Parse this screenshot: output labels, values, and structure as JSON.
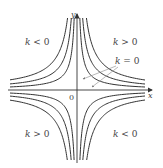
{
  "diagram": {
    "axes": {
      "x_label": "x",
      "y_label": "y",
      "origin_label": "0",
      "origin_px": [
        77,
        90
      ]
    },
    "regions": [
      {
        "id": "top-left",
        "label": "k < 0",
        "var": "k",
        "rel": "< 0"
      },
      {
        "id": "top-right",
        "label": "k > 0",
        "var": "k",
        "rel": "> 0"
      },
      {
        "id": "bottom-left",
        "label": "k > 0",
        "var": "k",
        "rel": "> 0"
      },
      {
        "id": "bottom-right",
        "label": "k < 0",
        "var": "k",
        "rel": "< 0"
      }
    ],
    "annotation": {
      "label": "k = 0",
      "var": "k",
      "rel": "= 0",
      "points_to": "coordinate axes"
    },
    "curves": {
      "family": "xy = k",
      "k_values_px": [
        204,
        408,
        680
      ],
      "count_per_quadrant": 3
    },
    "colors": {
      "curve": "#333333",
      "axis": "#333333",
      "text": "#444444",
      "arrow": "#888888"
    }
  }
}
